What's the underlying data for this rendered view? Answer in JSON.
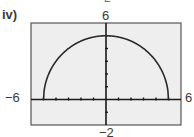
{
  "panel": {
    "label": "iv)",
    "partial_top_char": "2"
  },
  "chart_data": {
    "type": "line",
    "title": "",
    "panel_label": "iv)",
    "function": "y = sqrt(25 - x^2)",
    "xlabel": "",
    "ylabel": "",
    "xlim": [
      -6,
      6
    ],
    "ylim": [
      -2,
      6
    ],
    "x_tick_step": 1,
    "y_tick_step": 1,
    "tick_labels": {
      "xmin": "−6",
      "xmax": "6",
      "ymin": "−2",
      "ymax": "6"
    },
    "grid": false,
    "legend": null,
    "series": [
      {
        "name": "semicircle",
        "x": [
          -5,
          -4.5,
          -4,
          -3,
          -2,
          -1,
          0,
          1,
          2,
          3,
          4,
          4.5,
          5
        ],
        "values": [
          0,
          2.18,
          3,
          4,
          4.58,
          4.9,
          5,
          4.9,
          4.58,
          4,
          3,
          2.18,
          0
        ]
      }
    ],
    "colors": {
      "curve": "#2a2a2a",
      "axes": "#1a1a1a",
      "plot_background": "#eeeeee",
      "frame": "#555555"
    }
  }
}
